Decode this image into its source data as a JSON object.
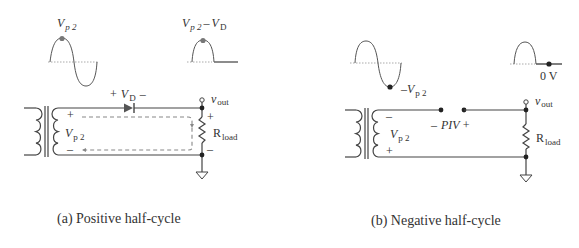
{
  "figure": {
    "panel_a": {
      "caption": "(a) Positive half-cycle",
      "input_waveform_label": {
        "main": "V",
        "sub": "p 2"
      },
      "output_waveform_label": {
        "main1": "V",
        "sub1": "p 2",
        "dash": "–",
        "main2": "V",
        "sub2": "D"
      },
      "diode_label": {
        "plus": "+",
        "main": "V",
        "sub": "D",
        "minus": "–"
      },
      "vout_label": {
        "main": "v",
        "sub": "out"
      },
      "load_label": {
        "main": "R",
        "sub": "load"
      },
      "secondary_label": {
        "main": "V",
        "sub": "p 2"
      },
      "secondary_polarity": {
        "top": "+",
        "bottom": "–"
      },
      "load_polarity": {
        "top": "+",
        "bottom": "–"
      }
    },
    "panel_b": {
      "caption": "(b) Negative half-cycle",
      "input_waveform_label": {
        "main": "–V",
        "sub": "p 2"
      },
      "output_waveform_label": "0 V",
      "piv_label": {
        "minus": "–",
        "main": "PIV",
        "plus": "+"
      },
      "vout_label": {
        "main": "v",
        "sub": "out"
      },
      "load_label": {
        "main": "R",
        "sub": "load"
      },
      "secondary_label": {
        "main": "V",
        "sub": "p 2"
      },
      "secondary_polarity": {
        "top": "–",
        "bottom": "+"
      }
    },
    "colors": {
      "wire": "#444444",
      "text": "#333333",
      "dot_highlight": "#777777",
      "dot_dark": "#222222",
      "axis": "#aaaaaa",
      "current_path": "#888888"
    }
  }
}
